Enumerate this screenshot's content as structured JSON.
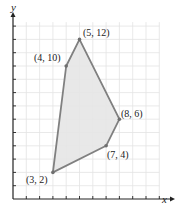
{
  "chart_data": {
    "type": "scatter",
    "title": "",
    "xlabel": "x",
    "ylabel": "y",
    "xlim": [
      0,
      11
    ],
    "ylim": [
      0,
      13
    ],
    "grid": true,
    "series": [
      {
        "name": "feasible region polygon",
        "points": [
          [
            3,
            2
          ],
          [
            4,
            10
          ],
          [
            5,
            12
          ],
          [
            8,
            6
          ],
          [
            7,
            4
          ]
        ],
        "fill": "#e6e6e6",
        "stroke": "#808080"
      }
    ],
    "annotations": [
      {
        "text": "(5, 12)",
        "x": 5,
        "y": 12
      },
      {
        "text": "(4, 10)",
        "x": 4,
        "y": 10
      },
      {
        "text": "(8, 6)",
        "x": 8,
        "y": 6
      },
      {
        "text": "(7, 4)",
        "x": 7,
        "y": 4
      },
      {
        "text": "(3, 2)",
        "x": 3,
        "y": 2
      }
    ]
  },
  "labels": {
    "x_axis": "x",
    "y_axis": "y",
    "p1": "(5, 12)",
    "p2": "(4, 10)",
    "p3": "(8, 6)",
    "p4": "(7, 4)",
    "p5": "(3, 2)"
  }
}
